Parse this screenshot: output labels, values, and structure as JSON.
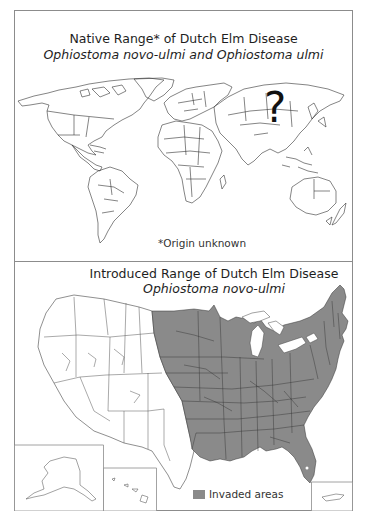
{
  "native_panel": {
    "title": "Native Range* of Dutch Elm Disease",
    "subtitle": "Ophiostoma novo-ulmi and Ophiostoma ulmi",
    "question_mark": "?",
    "footnote": "*Origin unknown"
  },
  "introduced_panel": {
    "title": "Introduced Range of Dutch Elm Disease",
    "subtitle": "Ophiostoma novo-ulmi",
    "legend": {
      "label": "Invaded areas",
      "color": "#8a8a8a"
    },
    "insets": [
      "Alaska",
      "Hawaii",
      "Puerto Rico"
    ]
  },
  "colors": {
    "frame": "#8c8c8c",
    "invaded": "#8a8a8a",
    "outline": "#333333"
  }
}
